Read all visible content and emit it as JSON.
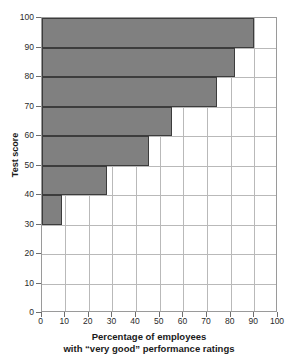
{
  "chart_data": {
    "type": "bar",
    "orientation": "horizontal",
    "title": "",
    "xlabel": "Percentage of employees with \"very good\" performance ratings",
    "xlabel_line1": "Percentage of employees",
    "xlabel_line2": "with “very good” performance ratings",
    "ylabel": "Test score",
    "xlim": [
      0,
      100
    ],
    "ylim": [
      0,
      100
    ],
    "xticks": [
      0,
      10,
      20,
      30,
      40,
      50,
      60,
      70,
      80,
      90,
      100
    ],
    "yticks": [
      0,
      10,
      20,
      30,
      40,
      50,
      60,
      70,
      80,
      90,
      100
    ],
    "grid": true,
    "legend": "none",
    "bin_width": 10,
    "categories": [
      "30-40",
      "40-50",
      "50-60",
      "60-70",
      "70-80",
      "80-90",
      "90-100"
    ],
    "values": [
      8.5,
      27.5,
      45.5,
      55,
      74,
      82,
      90
    ],
    "bars": [
      {
        "bin_low": 90,
        "bin_high": 100,
        "value": 90
      },
      {
        "bin_low": 80,
        "bin_high": 90,
        "value": 82
      },
      {
        "bin_low": 70,
        "bin_high": 80,
        "value": 74
      },
      {
        "bin_low": 60,
        "bin_high": 70,
        "value": 55
      },
      {
        "bin_low": 50,
        "bin_high": 60,
        "value": 45.5
      },
      {
        "bin_low": 40,
        "bin_high": 50,
        "value": 27.5
      },
      {
        "bin_low": 30,
        "bin_high": 40,
        "value": 8.5
      }
    ],
    "colors": {
      "bar_fill": "#808080",
      "bar_border": "#3c3c3c",
      "gridline": "#b9b9b9",
      "frame": "#9a9a9a",
      "text": "#1a1a1a",
      "background": "#ffffff"
    }
  }
}
